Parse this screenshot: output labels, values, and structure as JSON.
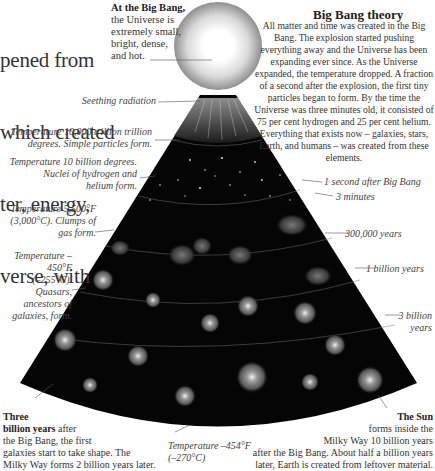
{
  "intro_text": [
    "pened from",
    "which created",
    "ter, energy,",
    "verse, with"
  ],
  "big_bang_label": {
    "bold": "At the Big Bang,",
    "lines": [
      "the Universe is",
      "extremely small,",
      "bright, dense,",
      "and hot."
    ]
  },
  "theory": {
    "title": "Big Bang theory",
    "body": "All matter and time was created in the Big Bang. The explosion started pushing everything away and the Universe has been expanding ever since. As the Universe expanded, the temperature dropped. A fraction of a second after the explosion, the first tiny particles began to form. By the time the Universe was three minutes old, it consisted of 75 per cent hydrogen and 25 per cent helium. Everything that exists now – galaxies, stars, Earth, and humans – was created from these elements."
  },
  "left_notes": [
    {
      "id": "seething",
      "text": "Seething radiation"
    },
    {
      "id": "particles",
      "lines": [
        "Temperature 10,000 trillion trillion",
        "degrees. Simple particles form."
      ]
    },
    {
      "id": "nuclei",
      "lines": [
        "Temperature 10 billion degrees.",
        "Nuclei of hydrogen and",
        "helium form."
      ]
    },
    {
      "id": "clumps",
      "lines": [
        "Temperature 5,500°F",
        "(3,000°C). Clumps of",
        "gas form."
      ]
    },
    {
      "id": "quasars",
      "lines": [
        "Temperature –450°F",
        "(–255°C). Quasars,",
        "ancestors of",
        "galaxies, form."
      ]
    }
  ],
  "right_timeline": [
    {
      "id": "one-second",
      "text": "1 second after Big Bang"
    },
    {
      "id": "three-minutes",
      "text": "3 minutes"
    },
    {
      "id": "300k-years",
      "text": "300,000 years"
    },
    {
      "id": "1-billion",
      "text": "1 billion years"
    },
    {
      "id": "3-billion",
      "lines": [
        "3 billion",
        "years"
      ]
    }
  ],
  "bottom_left": {
    "bold": [
      "Three",
      "billion years"
    ],
    "after": " after",
    "lines": [
      "the Big Bang, the first",
      "galaxies start to take shape. The",
      "Milky Way forms 2 billion years later."
    ]
  },
  "bottom_center": {
    "lines": [
      "Temperature –454°F",
      "(–270°C)"
    ]
  },
  "bottom_right": {
    "bold": "The Sun",
    "lines": [
      "forms inside the",
      "Milky Way 10 billion years",
      "after the Big Bang. About half a billion years",
      "later, Earth is created from leftover material."
    ]
  },
  "colors": {
    "cone": "#050505",
    "ball_core": "#ffffff",
    "ball_edge": "#8a8a8a",
    "text": "#333333",
    "leader": "#555555"
  }
}
